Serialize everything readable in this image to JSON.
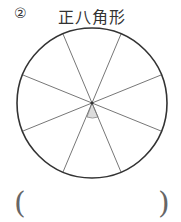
{
  "problem": {
    "number": "②",
    "title": "正八角形"
  },
  "figure": {
    "shape": "circle divided into 8 equal sectors",
    "center": [
      92,
      103
    ],
    "radius": 75,
    "divisions": 8,
    "marked_angle": "shaded sector angle at center (bottom)",
    "shade_color": "#dcdcdc"
  },
  "answer": {
    "open_paren": "(",
    "close_paren": ")",
    "value": ""
  }
}
